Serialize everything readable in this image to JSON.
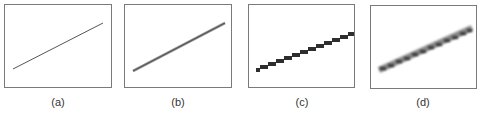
{
  "figure": {
    "panels": [
      {
        "id": "a",
        "caption": "(a)",
        "description": "thin ideal line"
      },
      {
        "id": "b",
        "caption": "(b)",
        "description": "slightly thicker anti-aliased line"
      },
      {
        "id": "c",
        "caption": "(c)",
        "description": "jagged aliased stair-step line"
      },
      {
        "id": "d",
        "caption": "(d)",
        "description": "blurred anti-aliased stair-step line"
      }
    ]
  },
  "colors": {
    "frame": "#7a7a7a",
    "line": "#444444",
    "block": "#2e2e2e",
    "caption": "#333333"
  }
}
